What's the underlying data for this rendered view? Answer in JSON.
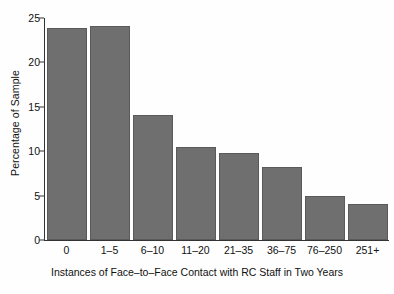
{
  "chart_data": {
    "type": "bar",
    "title": "",
    "xlabel": "Instances of Face–to–Face Contact with RC Staff in Two Years",
    "ylabel": "Percentage of Sample",
    "categories": [
      "0",
      "1–5",
      "6–10",
      "11–20",
      "21–35",
      "36–75",
      "76–250",
      "251+"
    ],
    "values": [
      23.9,
      24.1,
      14.1,
      10.5,
      9.8,
      8.2,
      5.0,
      4.1
    ],
    "ylim": [
      0,
      25
    ],
    "yticks": [
      0,
      5,
      10,
      15,
      20,
      25
    ],
    "ytick_labels": [
      "0",
      "5",
      "10",
      "15",
      "20",
      "25"
    ],
    "grid": false,
    "legend": false,
    "bar_color": "#6f6f6f",
    "bar_edge_color": "#5a5a5a",
    "axis_color": "#333333",
    "background_color": "#ffffff"
  }
}
